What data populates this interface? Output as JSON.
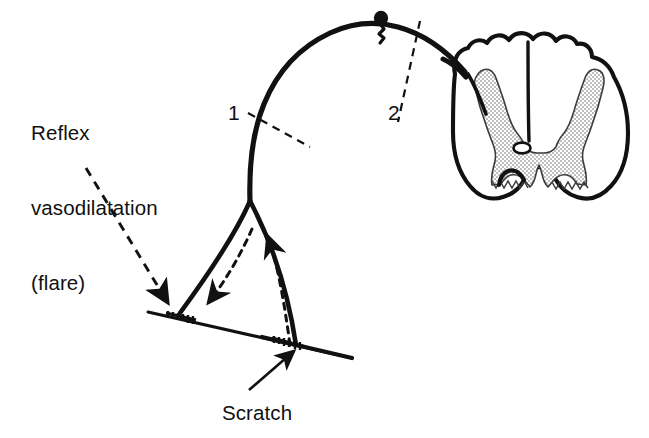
{
  "figure": {
    "background_color": "#ffffff",
    "ink_color": "#111111",
    "width": 649,
    "height": 438
  },
  "labels": {
    "flare": "Reflex\nvasodilatation\n(flare)",
    "flare_line_1": "Reflex",
    "flare_line_2": "vasodilatation",
    "flare_line_3": "(flare)",
    "scratch": "Scratch",
    "marker_1": "1",
    "marker_2": "2"
  },
  "annotations": [
    {
      "name": "flare-leader",
      "style": "dashed-arrow",
      "from": [
        86,
        168
      ],
      "to": [
        168,
        305
      ],
      "points_to": "left-nerve-terminal"
    },
    {
      "name": "scratch-leader",
      "style": "solid-arrow",
      "from": [
        249,
        390
      ],
      "to": [
        296,
        350
      ],
      "points_to": "right-nerve-terminal"
    },
    {
      "name": "section-marker-1",
      "style": "dashed-line",
      "from": [
        249,
        115
      ],
      "to": [
        308,
        146
      ],
      "crosses": "afferent-nerve-fibre"
    },
    {
      "name": "section-marker-2",
      "style": "dashed-line",
      "from": [
        419,
        22
      ],
      "to": [
        399,
        122
      ],
      "crosses": "dorsal-root"
    }
  ],
  "structures": {
    "skin_line": {
      "name": "skin-surface",
      "from": [
        148,
        312
      ],
      "to": [
        352,
        358
      ]
    },
    "nerve_terminals": [
      {
        "name": "left-nerve-terminal",
        "position": [
          178,
          318
        ],
        "type": "comb-ending"
      },
      {
        "name": "right-nerve-terminal",
        "position": [
          292,
          344
        ],
        "type": "comb-ending"
      }
    ],
    "bifurcation": {
      "name": "axon-branch-point",
      "position": [
        250,
        201
      ]
    },
    "ganglion": {
      "name": "dorsal-root-ganglion",
      "cell_body": [
        378,
        19
      ],
      "stalk_base": [
        380,
        42
      ]
    },
    "spinal_cord": {
      "name": "spinal-cord-cross-section",
      "centre": [
        540,
        120
      ],
      "features": [
        "white-matter-outline",
        "grey-matter-butterfly",
        "central-canal",
        "dorsal-median-sulcus",
        "ventral-median-fissure",
        "dorsal-horn",
        "ventral-horn"
      ]
    },
    "impulse_arrows": [
      {
        "name": "antidromic-impulse-arrow",
        "direction": "down-left",
        "style": "dashed",
        "meaning": "reflex vasodilatation"
      },
      {
        "name": "orthodromic-impulse-arrow",
        "direction": "up-left",
        "style": "dashed",
        "meaning": "afferent impulse from scratch"
      }
    ]
  },
  "colors": {
    "ink": "#111111",
    "paper": "#ffffff",
    "grey_matter_stipple": "#6f6f6f"
  }
}
